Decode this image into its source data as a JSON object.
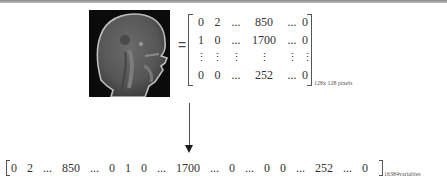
{
  "figure": {
    "image_label": "sagittal brain MRI slice",
    "equals_sign": "=",
    "matrix": {
      "rows": [
        [
          "0",
          "2",
          "...",
          "850",
          "...",
          "0"
        ],
        [
          "1",
          "0",
          "...",
          "1700",
          "...",
          "0"
        ],
        [
          "⋮",
          "⋮",
          "⋮",
          "⋮",
          "⋮",
          "⋮"
        ],
        [
          "0",
          "0",
          "...",
          "252",
          "...",
          "0"
        ]
      ],
      "subscript": "128x 128 pixels"
    },
    "arrow": "down",
    "vector": {
      "values": [
        "0",
        "2",
        "...",
        "850",
        "...",
        "0",
        "1",
        "0",
        "...",
        "1700",
        "...",
        "0",
        "...",
        "0",
        "0",
        "...",
        "252",
        "...",
        "0"
      ],
      "subscript": "16384variables"
    }
  },
  "colors": {
    "background": "#ffffff",
    "text": "#333333",
    "border": "#8a8a8a",
    "image_bg": "#0b0b0b"
  }
}
